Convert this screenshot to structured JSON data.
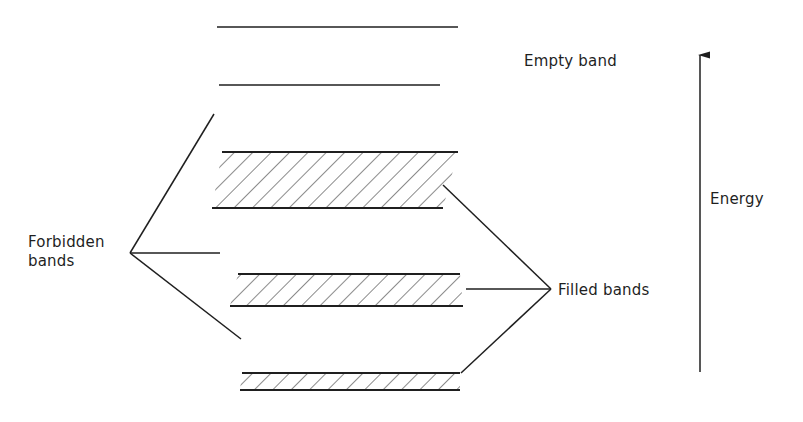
{
  "figure": {
    "type": "energy-band-diagram",
    "labels": {
      "empty_band": "Empty band",
      "energy": "Energy",
      "filled_bands": "Filled bands",
      "forbidden_line1": "Forbidden",
      "forbidden_line2": "bands"
    },
    "colors": {
      "line": "#1f1f1f",
      "hatch": "#2a2a2a",
      "background": "#ffffff"
    },
    "empty_levels": [
      {
        "x1": 217,
        "x2": 458,
        "y": 27
      },
      {
        "x1": 219,
        "x2": 440,
        "y": 85
      }
    ],
    "filled_bands": [
      {
        "top": {
          "x1": 222,
          "x2": 458,
          "y": 152
        },
        "bottom": {
          "x1": 212,
          "x2": 443,
          "y": 208
        }
      },
      {
        "top": {
          "x1": 238,
          "x2": 460,
          "y": 274
        },
        "bottom": {
          "x1": 230,
          "x2": 463,
          "y": 306
        }
      },
      {
        "top": {
          "x1": 242,
          "x2": 460,
          "y": 373
        },
        "bottom": {
          "x1": 240,
          "x2": 460,
          "y": 390
        }
      }
    ],
    "forbidden_pointer": {
      "vertex": [
        130,
        253
      ],
      "targets": [
        [
          214,
          114
        ],
        [
          220,
          253
        ],
        [
          241,
          339
        ]
      ]
    },
    "filled_pointer": {
      "vertex": [
        551,
        289
      ],
      "targets": [
        [
          443,
          185
        ],
        [
          466,
          289
        ],
        [
          461,
          373
        ]
      ]
    },
    "energy_axis": {
      "x": 700,
      "y_bottom": 372,
      "y_top": 55,
      "direction": "up"
    }
  }
}
